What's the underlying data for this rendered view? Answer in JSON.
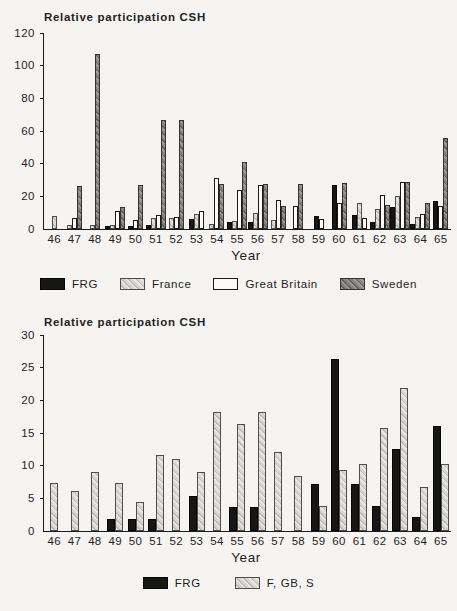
{
  "figure": {
    "background": "#f6f4f1",
    "ink": "#1b1b1b",
    "bar_colors": {
      "solid_black": "#161616",
      "light_hatch_base": "#cccbc7",
      "white": "#fcfbf9",
      "dark_hatch_base": "#7e7d79"
    }
  },
  "chart_data": [
    {
      "type": "bar",
      "title": "Relative participation CSH",
      "xlabel": "Year",
      "ylabel": "Relative participation CSH",
      "ylim": [
        0,
        120
      ],
      "yticks": [
        0,
        20,
        40,
        60,
        80,
        100,
        120
      ],
      "grid": false,
      "legend_position": "bottom",
      "categories": [
        "46",
        "47",
        "48",
        "49",
        "50",
        "51",
        "52",
        "53",
        "54",
        "55",
        "56",
        "57",
        "58",
        "59",
        "60",
        "61",
        "62",
        "63",
        "64",
        "65"
      ],
      "series": [
        {
          "name": "FRG",
          "pattern": "solid-black",
          "values": [
            0,
            0,
            0,
            2,
            2,
            2.5,
            0,
            6,
            0,
            4.5,
            4,
            0,
            0,
            8,
            27,
            8.5,
            4.5,
            13.5,
            3,
            17
          ]
        },
        {
          "name": "France",
          "pattern": "light-hatch",
          "values": [
            8,
            2.5,
            2.5,
            2.5,
            0,
            6.5,
            7,
            9,
            3,
            5,
            10,
            5.5,
            0,
            0,
            0,
            16,
            12,
            20,
            7.5,
            0
          ]
        },
        {
          "name": "Great Britain",
          "pattern": "white",
          "values": [
            0,
            7,
            0,
            11,
            5.5,
            8.5,
            7.5,
            11,
            31,
            24,
            27,
            18,
            14,
            6,
            16,
            7,
            21,
            28.5,
            9,
            14
          ]
        },
        {
          "name": "Sweden",
          "pattern": "dark-hatch",
          "values": [
            0,
            26.5,
            107,
            13.5,
            27,
            67,
            67,
            0,
            27.5,
            41,
            27.5,
            14,
            27.5,
            0,
            28,
            0,
            15,
            28.5,
            16,
            56
          ]
        }
      ]
    },
    {
      "type": "bar",
      "title": "Relative participation CSH",
      "xlabel": "Year",
      "ylabel": "Relative participation CSH",
      "ylim": [
        0,
        30
      ],
      "yticks": [
        0,
        5,
        10,
        15,
        20,
        25,
        30
      ],
      "grid": false,
      "legend_position": "bottom",
      "categories": [
        "46",
        "47",
        "48",
        "49",
        "50",
        "51",
        "52",
        "53",
        "54",
        "55",
        "56",
        "57",
        "58",
        "59",
        "60",
        "61",
        "62",
        "63",
        "64",
        "65"
      ],
      "series": [
        {
          "name": "FRG",
          "pattern": "solid-black",
          "values": [
            0,
            0,
            0,
            1.9,
            1.9,
            1.9,
            0,
            5.4,
            0,
            3.6,
            3.6,
            0,
            0,
            7.2,
            26.4,
            7.2,
            3.9,
            12.6,
            2.2,
            16.1
          ]
        },
        {
          "name": "F, GB, S",
          "pattern": "light-hatch",
          "values": [
            7.3,
            6.2,
            9,
            7.3,
            4.5,
            11.7,
            11,
            9,
            18.2,
            16.4,
            18.2,
            12.1,
            8.4,
            3.9,
            9.3,
            10.2,
            15.8,
            21.9,
            6.7,
            10.2
          ]
        }
      ]
    }
  ]
}
